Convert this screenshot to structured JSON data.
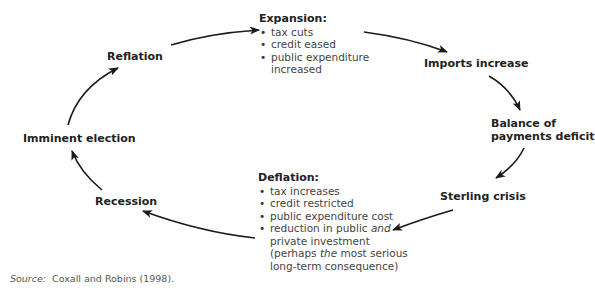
{
  "diagram": {
    "type": "cycle",
    "nodes": {
      "expansion": {
        "heading": "Expansion:",
        "items": [
          "tax cuts",
          "credit eased",
          "public expenditure",
          "increased"
        ]
      },
      "imports": "Imports increase",
      "balance_line1": "Balance of",
      "balance_line2": "payments deficit",
      "sterling": "Sterling crisis",
      "deflation": {
        "heading": "Deflation:",
        "items": [
          "tax increases",
          "credit restricted",
          "public expenditure cost"
        ],
        "item4_a": "reduction in public ",
        "item4_em": "and",
        "item4_b": "private investment",
        "item4_c_a": "(perhaps ",
        "item4_c_em": "the",
        "item4_c_b": " most serious",
        "item4_d": "long-term consequence)"
      },
      "recession": "Recession",
      "election": "Imminent election",
      "reflation": "Reflation"
    },
    "flow": [
      "Expansion",
      "Imports increase",
      "Balance of payments deficit",
      "Sterling crisis",
      "Deflation",
      "Recession",
      "Imminent election",
      "Reflation",
      "Expansion"
    ],
    "arrow_color": "#1a1a1a"
  },
  "source": {
    "label": "Source:",
    "text": "Coxall and Robins (1998)."
  }
}
